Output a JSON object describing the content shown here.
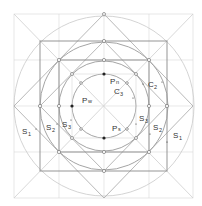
{
  "diagram": {
    "title": "",
    "labels": {
      "pn": {
        "base": "P",
        "sub": "n"
      },
      "pw": {
        "base": "P",
        "sub": "w"
      },
      "ps": {
        "base": "P",
        "sub": "s"
      },
      "c2": {
        "base": "C",
        "sub": "2"
      },
      "c3": {
        "base": "C",
        "sub": "3"
      },
      "s1_left": {
        "base": "S",
        "sub": "1",
        "prime": "'"
      },
      "s2_left": {
        "base": "S",
        "sub": "2",
        "prime": "'"
      },
      "s3_left": {
        "base": "S",
        "sub": "3",
        "prime": "'"
      },
      "s3_right": {
        "base": "S",
        "sub": "3",
        "prime": "'"
      },
      "s2_right": {
        "base": "S",
        "sub": "2",
        "prime": ""
      },
      "s1_right": {
        "base": "S",
        "sub": "1",
        "prime": "'"
      }
    },
    "geometry": {
      "center": [
        104,
        106
      ],
      "outer_frame": [
        14,
        14,
        193,
        198
      ],
      "outer_circle_r": 90,
      "circle_c2_r": 64,
      "circle_c3_r": 45,
      "inner_circle_r": 32,
      "dark_square": [
        40,
        41,
        167,
        171
      ]
    },
    "colors": {
      "line_light": "#d4d4d4",
      "line_mid": "#9a9a9a",
      "line_dark": "#8a8a8a",
      "text": "#333333"
    }
  }
}
